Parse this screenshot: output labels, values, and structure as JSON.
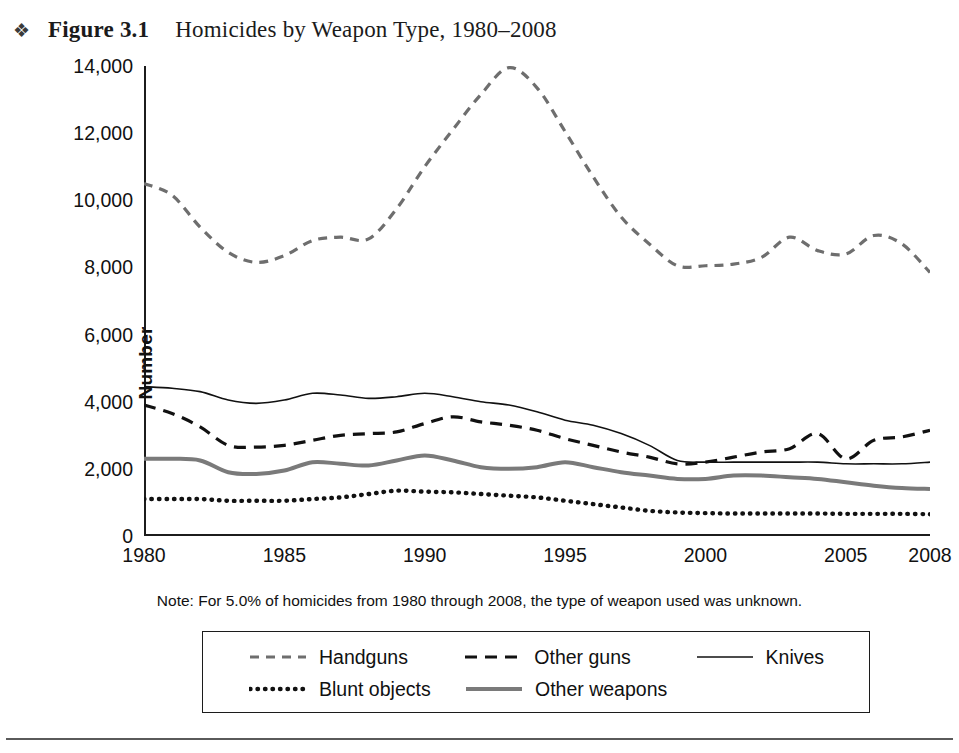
{
  "figure": {
    "bullet": "❖",
    "label": "Figure 3.1",
    "title": "Homicides by Weapon Type, 1980–2008",
    "note": "Note: For 5.0% of homicides from 1980 through 2008, the type of weapon used was unknown."
  },
  "legend": [
    {
      "label": "Handguns",
      "style": "dashed",
      "color": "#6e6e6e",
      "width": 3.2,
      "dash": "9,7"
    },
    {
      "label": "Other guns",
      "style": "dashed",
      "color": "#111111",
      "width": 3.2,
      "dash": "12,8"
    },
    {
      "label": "Knives",
      "style": "solid",
      "color": "#111111",
      "width": 1.6,
      "dash": ""
    },
    {
      "label": "Blunt objects",
      "style": "dotted",
      "color": "#111111",
      "width": 4.4,
      "dash": "0.5,7"
    },
    {
      "label": "Other weapons",
      "style": "solid-thick",
      "color": "#7a7a7a",
      "width": 4.0,
      "dash": ""
    }
  ],
  "chart_data": {
    "type": "line",
    "title": "Homicides by Weapon Type, 1980–2008",
    "xlabel": "",
    "ylabel": "Number",
    "xlim": [
      1980,
      2008
    ],
    "ylim": [
      0,
      14000
    ],
    "grid": false,
    "legend_position": "bottom",
    "xticks": [
      1980,
      1985,
      1990,
      1995,
      2000,
      2005,
      2008
    ],
    "yticks": [
      0,
      2000,
      4000,
      6000,
      8000,
      10000,
      12000,
      14000
    ],
    "ytick_labels": [
      "0",
      "2,000",
      "4,000",
      "6,000",
      "8,000",
      "10,000",
      "12,000",
      "14,000"
    ],
    "x": [
      1980,
      1981,
      1982,
      1983,
      1984,
      1985,
      1986,
      1987,
      1988,
      1989,
      1990,
      1991,
      1992,
      1993,
      1994,
      1995,
      1996,
      1997,
      1998,
      1999,
      2000,
      2001,
      2002,
      2003,
      2004,
      2005,
      2006,
      2007,
      2008
    ],
    "series": [
      {
        "name": "Handguns",
        "color": "#6e6e6e",
        "values": [
          10500,
          10150,
          9200,
          8450,
          8150,
          8350,
          8800,
          8900,
          8850,
          9750,
          11000,
          12100,
          13150,
          13950,
          13350,
          12050,
          10700,
          9500,
          8700,
          8050,
          8050,
          8100,
          8300,
          8900,
          8500,
          8400,
          8950,
          8700,
          7850
        ]
      },
      {
        "name": "Other guns",
        "color": "#111111",
        "values": [
          3900,
          3650,
          3250,
          2700,
          2650,
          2700,
          2850,
          3000,
          3050,
          3100,
          3350,
          3550,
          3400,
          3300,
          3150,
          2900,
          2700,
          2500,
          2350,
          2150,
          2200,
          2350,
          2500,
          2600,
          3050,
          2300,
          2850,
          2950,
          3150
        ]
      },
      {
        "name": "Knives",
        "color": "#111111",
        "values": [
          4450,
          4400,
          4300,
          4050,
          3950,
          4050,
          4250,
          4200,
          4100,
          4150,
          4250,
          4150,
          4000,
          3900,
          3700,
          3450,
          3300,
          3050,
          2700,
          2250,
          2200,
          2200,
          2200,
          2200,
          2200,
          2150,
          2150,
          2150,
          2200
        ]
      },
      {
        "name": "Blunt objects",
        "color": "#111111",
        "values": [
          1100,
          1100,
          1100,
          1050,
          1050,
          1050,
          1100,
          1150,
          1250,
          1350,
          1320,
          1300,
          1250,
          1200,
          1150,
          1050,
          950,
          850,
          750,
          700,
          680,
          670,
          670,
          670,
          670,
          660,
          660,
          660,
          650
        ]
      },
      {
        "name": "Other weapons",
        "color": "#7a7a7a",
        "values": [
          2300,
          2300,
          2250,
          1900,
          1850,
          1950,
          2200,
          2150,
          2100,
          2250,
          2400,
          2250,
          2050,
          2000,
          2050,
          2200,
          2050,
          1900,
          1800,
          1700,
          1700,
          1800,
          1800,
          1750,
          1700,
          1600,
          1500,
          1430,
          1400
        ]
      }
    ]
  }
}
